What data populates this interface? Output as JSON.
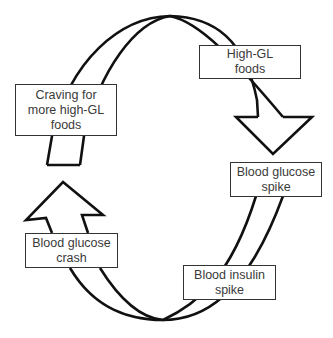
{
  "diagram": {
    "type": "cycle",
    "stroke_color": "#111111",
    "box_border_color": "#333333",
    "text_color": "#3a3a3a",
    "nodes": [
      {
        "id": "high-gl-foods",
        "label": "High-GL\nfoods"
      },
      {
        "id": "blood-glucose-spike",
        "label": "Blood glucose\nspike"
      },
      {
        "id": "blood-insulin-spike",
        "label": "Blood insulin\nspike"
      },
      {
        "id": "blood-glucose-crash",
        "label": "Blood glucose\ncrash"
      },
      {
        "id": "craving",
        "label": "Craving for\nmore high-GL\nfoods"
      }
    ],
    "edges": [
      {
        "from": "craving",
        "to": "high-gl-foods"
      },
      {
        "from": "high-gl-foods",
        "to": "blood-glucose-spike"
      },
      {
        "from": "blood-glucose-spike",
        "to": "blood-insulin-spike"
      },
      {
        "from": "blood-insulin-spike",
        "to": "blood-glucose-crash"
      },
      {
        "from": "blood-glucose-crash",
        "to": "craving"
      }
    ]
  }
}
